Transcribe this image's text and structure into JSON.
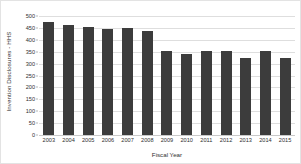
{
  "chart_data": {
    "type": "bar",
    "title": "",
    "xlabel": "Fiscal Year",
    "ylabel": "Invention Disclosures - HHS",
    "categories": [
      "2003",
      "2004",
      "2005",
      "2006",
      "2007",
      "2008",
      "2009",
      "2010",
      "2011",
      "2012",
      "2013",
      "2014",
      "2015"
    ],
    "values": [
      473,
      462,
      453,
      444,
      448,
      438,
      355,
      340,
      353,
      355,
      323,
      353,
      323
    ],
    "ylim": [
      0,
      500
    ],
    "yticks": [
      500,
      450,
      400,
      350,
      300,
      250,
      200,
      150,
      100,
      50,
      0
    ],
    "xlim_categories": 13,
    "grid": true,
    "legend": false,
    "series": [
      {
        "name": "Invention Disclosures - HHS",
        "values": [
          473,
          462,
          453,
          444,
          448,
          438,
          355,
          340,
          353,
          355,
          323,
          353,
          323
        ]
      }
    ]
  },
  "style": {
    "bar_color": "#3c3c3c",
    "grid_color": "#dedede",
    "axis_color": "#c9c9c9",
    "text_color": "#2f2f2f",
    "background": "#ffffff",
    "border_color": "#e3e3e3"
  }
}
